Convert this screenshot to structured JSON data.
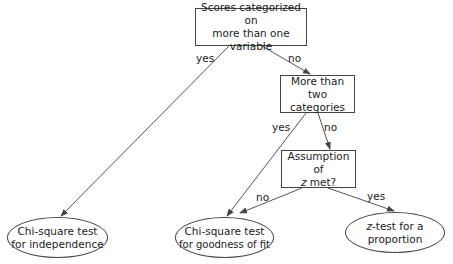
{
  "diagram": {
    "type": "decision-tree",
    "nodes": {
      "q1": {
        "line1": "Scores categorized on",
        "line2": "more than one variable"
      },
      "q2": {
        "line1": "More than",
        "line2": "two categories"
      },
      "q3": {
        "line1": "Assumption of",
        "line2_italic": "z",
        "line2_rest": " met?"
      },
      "r1": {
        "line1": "Chi-square test",
        "line2": "for independence"
      },
      "r2": {
        "line1": "Chi-square test",
        "line2": "for goodness of fit"
      },
      "r3": {
        "line1_italic": "z",
        "line1_rest": "-test for a",
        "line2": "proportion"
      }
    },
    "edges": [
      {
        "from": "q1",
        "to": "r1",
        "label": "yes"
      },
      {
        "from": "q1",
        "to": "q2",
        "label": "no"
      },
      {
        "from": "q2",
        "to": "r2",
        "label": "yes"
      },
      {
        "from": "q2",
        "to": "q3",
        "label": "no"
      },
      {
        "from": "q3",
        "to": "r2",
        "label": "no"
      },
      {
        "from": "q3",
        "to": "r3",
        "label": "yes"
      }
    ],
    "colors": {
      "stroke": "#444444",
      "text": "#222222",
      "background": "#ffffff"
    }
  }
}
